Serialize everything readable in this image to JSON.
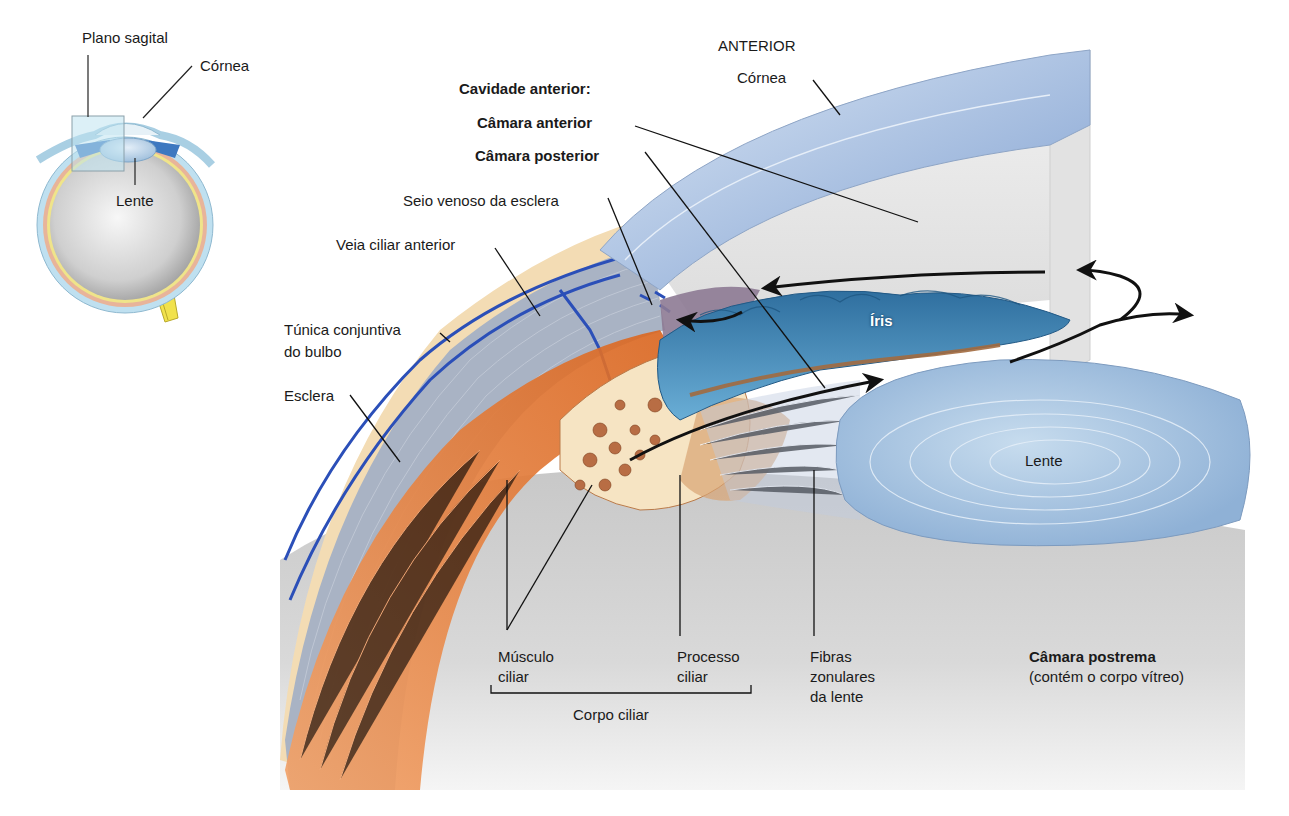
{
  "inset": {
    "labels": {
      "plano_sagital": "Plano sagital",
      "cornea": "Córnea",
      "lente": "Lente"
    }
  },
  "main": {
    "orientation": "ANTERIOR",
    "labels": {
      "cornea": "Córnea",
      "cavidade_anterior": "Cavidade anterior:",
      "camara_anterior": "Câmara anterior",
      "camara_posterior": "Câmara posterior",
      "seio_venoso": "Seio venoso da esclera",
      "veia_ciliar": "Veia ciliar anterior",
      "tunica_conjuntiva_1": "Túnica conjuntiva",
      "tunica_conjuntiva_2": "do bulbo",
      "esclera": "Esclera",
      "iris": "Íris",
      "lente": "Lente",
      "musculo_ciliar_1": "Músculo",
      "musculo_ciliar_2": "ciliar",
      "processo_ciliar_1": "Processo",
      "processo_ciliar_2": "ciliar",
      "corpo_ciliar": "Corpo ciliar",
      "fibras_1": "Fibras",
      "fibras_2": "zonulares",
      "fibras_3": "da lente",
      "camara_postrema": "Câmara postrema",
      "camara_postrema_sub": "(contém o corpo vítreo)"
    }
  },
  "colors": {
    "cornea": "#9fb8dc",
    "sclera": "#a9b3c4",
    "conjunctiva": "#f3dcb4",
    "muscle": "#e07a3a",
    "iris": "#3f7fb0",
    "lens": "#b9d3ea",
    "vitreous": "#d9d9d9",
    "vein": "#2b4fb8",
    "optic_nerve": "#f0e04a"
  }
}
